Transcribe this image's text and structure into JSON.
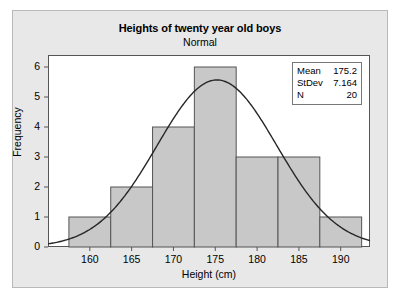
{
  "chart_data": {
    "type": "bar",
    "title": "Heights of twenty year old boys",
    "subtitle": "Normal",
    "xlabel": "Height (cm)",
    "ylabel": "Frequency",
    "xlim": [
      155.0,
      193.5
    ],
    "ylim": [
      0,
      6.4
    ],
    "grid": false,
    "legend": "none",
    "bin_width": 5,
    "bin_edges": [
      157.5,
      162.5,
      167.5,
      172.5,
      177.5,
      182.5,
      187.5,
      192.5
    ],
    "bin_centers": [
      160,
      165,
      170,
      175,
      180,
      185,
      190
    ],
    "categories": [
      "160",
      "165",
      "170",
      "175",
      "180",
      "185",
      "190"
    ],
    "values": [
      1,
      2,
      4,
      6,
      3,
      3,
      1
    ],
    "xticks": [
      160,
      165,
      170,
      175,
      180,
      185,
      190
    ],
    "xtick_labels": [
      "160",
      "165",
      "170",
      "175",
      "180",
      "185",
      "190"
    ],
    "yticks": [
      0,
      1,
      2,
      3,
      4,
      5,
      6
    ],
    "ytick_labels": [
      "0",
      "1",
      "2",
      "3",
      "4",
      "5",
      "6"
    ],
    "overlay": {
      "type": "line",
      "name": "Normal",
      "distribution": "normal",
      "mean": 175.2,
      "stdev": 7.164,
      "n": 20,
      "scale_bin_width": 5,
      "peak_value": 5.57
    },
    "bar_fill_color": "#c8c8c8",
    "bar_edge_color": "#555555",
    "curve_color": "#262626",
    "plot_background": "#ffffff",
    "figure_background": "#e8e8e8"
  },
  "stats_box": {
    "rows": [
      {
        "key": "Mean",
        "value": "175.2"
      },
      {
        "key": "StDev",
        "value": "7.164"
      },
      {
        "key": "N",
        "value": "20"
      }
    ]
  }
}
